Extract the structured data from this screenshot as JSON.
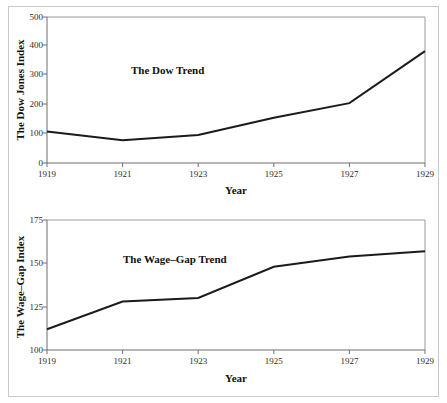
{
  "figure": {
    "background_color": "#ffffff",
    "frame_color": "#c9c9c9",
    "line_color": "#1b1b1b",
    "axis_color": "#6f6f6f"
  },
  "chart_data": [
    {
      "type": "line",
      "title": "The Dow Trend",
      "xlabel": "Year",
      "ylabel": "The Dow Jones Index",
      "x": [
        1919,
        1921,
        1923,
        1925,
        1927,
        1929
      ],
      "values": [
        108,
        78,
        96,
        155,
        205,
        383
      ],
      "categories": [
        "1919",
        "1921",
        "1923",
        "1925",
        "1927",
        "1929"
      ],
      "xticklabels": [
        "1919",
        "1921",
        "1923",
        "1925",
        "1927",
        "1929"
      ],
      "yticks": [
        0,
        100,
        200,
        300,
        400,
        500
      ],
      "yticklabels": [
        "0",
        "100",
        "200",
        "300",
        "400",
        "500"
      ],
      "xlim": [
        1919,
        1929
      ],
      "ylim": [
        0,
        500
      ],
      "grid": false,
      "legend": "none",
      "annotation": "The Dow Trend"
    },
    {
      "type": "line",
      "title": "The Wage–Gap Trend",
      "xlabel": "Year",
      "ylabel": "The Wage–Gap Index",
      "x": [
        1919,
        1921,
        1923,
        1925,
        1927,
        1929
      ],
      "values": [
        112,
        128,
        130,
        148,
        154,
        157
      ],
      "categories": [
        "1919",
        "1921",
        "1923",
        "1925",
        "1927",
        "1929"
      ],
      "xticklabels": [
        "1919",
        "1921",
        "1923",
        "1925",
        "1927",
        "1929"
      ],
      "yticks": [
        100,
        125,
        150,
        175
      ],
      "yticklabels": [
        "100",
        "125",
        "150",
        "175"
      ],
      "xlim": [
        1919,
        1929
      ],
      "ylim": [
        100,
        175
      ],
      "grid": false,
      "legend": "none",
      "annotation": "The Wage–Gap Trend"
    }
  ],
  "panels": {
    "top": {
      "annotation": "The Dow Trend",
      "ylabel": "The Dow Jones Index",
      "xlabel": "Year",
      "yticklabels": [
        "500",
        "400",
        "300",
        "200",
        "100",
        "0"
      ],
      "xticklabels": [
        "1919",
        "1921",
        "1923",
        "1925",
        "1927",
        "1929"
      ]
    },
    "bottom": {
      "annotation": "The Wage–Gap Trend",
      "ylabel": "The Wage–Gap Index",
      "xlabel": "Year",
      "yticklabels": [
        "175",
        "150",
        "125",
        "100"
      ],
      "xticklabels": [
        "1919",
        "1921",
        "1923",
        "1925",
        "1927",
        "1929"
      ]
    }
  }
}
